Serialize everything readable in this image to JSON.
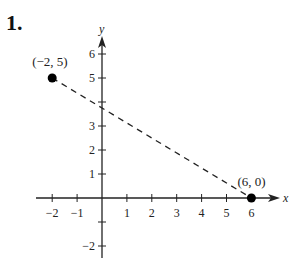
{
  "problem": {
    "number_label": "1."
  },
  "chart_data": {
    "type": "scatter",
    "title": "",
    "xlabel": "x",
    "ylabel": "y",
    "xlim": [
      -2.5,
      7
    ],
    "ylim": [
      -2.5,
      7
    ],
    "grid": false,
    "x_ticks": [
      -2,
      -1,
      1,
      2,
      3,
      4,
      5,
      6
    ],
    "y_ticks": [
      -2,
      -1,
      1,
      2,
      3,
      4,
      5,
      6
    ],
    "x_tick_labels": [
      "−2",
      "−1",
      "1",
      "2",
      "3",
      "4",
      "5",
      "6"
    ],
    "y_tick_labels": [
      "−2",
      "",
      "1",
      "2",
      "3",
      "",
      "5",
      "6"
    ],
    "points": [
      {
        "x": -2,
        "y": 5,
        "label": "(−2, 5)"
      },
      {
        "x": 6,
        "y": 0,
        "label": "(6, 0)"
      }
    ],
    "segments": [
      {
        "from": [
          -2,
          5
        ],
        "to": [
          6,
          0
        ],
        "style": "dashed"
      }
    ]
  },
  "colors": {
    "ink": "#222222",
    "point": "#000000",
    "background": "#ffffff"
  }
}
